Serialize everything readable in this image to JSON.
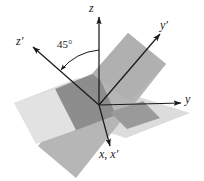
{
  "figure": {
    "type": "3d-coordinate-axes-diagram",
    "background_color": "#ffffff",
    "axis_color": "#1a1a1a",
    "labels": {
      "z": "z",
      "z_prime": "z′",
      "y": "y",
      "y_prime": "y′",
      "x_and_x_prime": "x, x′",
      "angle": "45°"
    },
    "planes": [
      {
        "name": "horizontal-plane-xy",
        "fill": "#dcdcdc",
        "description": "light gray horizontal plane containing x and y axes"
      },
      {
        "name": "tilted-plane-xy-prime",
        "fill": "#b4b4b4",
        "description": "medium gray plane rotated 45 degrees containing x and y-prime axes"
      },
      {
        "name": "plane-overlap-region",
        "fill": "#8c8c8c",
        "description": "darker gray region where the two planes overlap"
      }
    ],
    "axes": [
      {
        "name": "z-axis",
        "label": "z",
        "direction": "vertical up"
      },
      {
        "name": "z-prime-axis",
        "label": "z′",
        "direction": "up-left at 45 degrees from z"
      },
      {
        "name": "y-axis",
        "label": "y",
        "direction": "right horizontal"
      },
      {
        "name": "y-prime-axis",
        "label": "y′",
        "direction": "up-right diagonal"
      },
      {
        "name": "x-axis",
        "label": "x, x′",
        "direction": "down toward viewer"
      }
    ],
    "annotation": {
      "name": "angle-arc",
      "value": "45°",
      "between": [
        "z-axis",
        "z-prime-axis"
      ]
    }
  }
}
